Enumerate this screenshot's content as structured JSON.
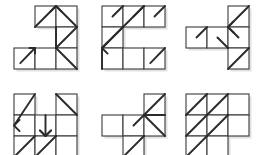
{
  "figure": {
    "background_color": "#ffffff",
    "grid_stroke_color": "#3a3a3a",
    "arrow_stroke_color": "#2b2b2b",
    "shadow_color": "#c9c9c9",
    "cell_size": 21,
    "panel_count": 6,
    "layout": {
      "columns": 3,
      "rows": 2
    }
  },
  "panels": [
    {
      "id": "panel-1",
      "name": "panel-top-left",
      "origin": {
        "x": 14,
        "y": 6
      },
      "cells": [
        {
          "col": 1,
          "row": 0
        },
        {
          "col": 2,
          "row": 0
        },
        {
          "col": 2,
          "row": 1
        },
        {
          "col": 0,
          "row": 2
        },
        {
          "col": 1,
          "row": 2
        },
        {
          "col": 2,
          "row": 2
        }
      ],
      "marks": [
        {
          "type": "line",
          "from": {
            "col": 1,
            "row": 0,
            "at": "bottom-left"
          },
          "to": {
            "col": 1,
            "row": 0,
            "at": "top-right"
          },
          "arrow": "none"
        },
        {
          "type": "line",
          "from": {
            "col": 2,
            "row": 0,
            "at": "bottom-right"
          },
          "to": {
            "col": 2,
            "row": 0,
            "at": "top-left"
          },
          "arrow": "none"
        },
        {
          "type": "arrowhead",
          "at": {
            "col": 2,
            "row": 0,
            "corner": "top-left"
          },
          "direction": "up"
        },
        {
          "type": "line",
          "from": {
            "col": 2,
            "row": 0,
            "at": "bottom-left"
          },
          "to": {
            "col": 2,
            "row": 1,
            "at": "bottom-left"
          },
          "arrow": "none"
        },
        {
          "type": "line",
          "from": {
            "col": 2,
            "row": 1,
            "at": "bottom-left"
          },
          "to": {
            "col": 2,
            "row": 1,
            "at": "top-right"
          },
          "arrow": "none"
        },
        {
          "type": "line",
          "from": {
            "col": 0,
            "row": 2,
            "at": "center-low"
          },
          "to": {
            "col": 0,
            "row": 2,
            "at": "top-right"
          },
          "arrow": "up-right"
        },
        {
          "type": "line",
          "from": {
            "col": 2,
            "row": 2,
            "at": "top-left"
          },
          "to": {
            "col": 2,
            "row": 2,
            "at": "bottom-right"
          },
          "arrow": "none"
        }
      ]
    },
    {
      "id": "panel-2",
      "name": "panel-top-center",
      "origin": {
        "x": 102,
        "y": 6
      },
      "cells": [
        {
          "col": 0,
          "row": 0
        },
        {
          "col": 1,
          "row": 0
        },
        {
          "col": 2,
          "row": 0
        },
        {
          "col": 0,
          "row": 1
        },
        {
          "col": 0,
          "row": 2
        },
        {
          "col": 1,
          "row": 2
        },
        {
          "col": 2,
          "row": 2
        }
      ],
      "marks": [
        {
          "type": "line",
          "from": {
            "col": 0,
            "row": 0,
            "at": "center"
          },
          "to": {
            "col": 0,
            "row": 0,
            "at": "top-right"
          },
          "arrow": "none"
        },
        {
          "type": "line",
          "from": {
            "col": 1,
            "row": 0,
            "at": "center"
          },
          "to": {
            "col": 1,
            "row": 0,
            "at": "top-right"
          },
          "arrow": "none"
        },
        {
          "type": "line",
          "from": {
            "col": 2,
            "row": 0,
            "at": "center"
          },
          "to": {
            "col": 2,
            "row": 0,
            "at": "top-right"
          },
          "arrow": "none"
        },
        {
          "type": "line",
          "from": {
            "col": 0,
            "row": 1,
            "at": "bottom-left"
          },
          "to": {
            "col": 1,
            "row": 0,
            "at": "top-right"
          },
          "arrow": "none",
          "note": "long diagonal spanning two cells"
        },
        {
          "type": "line",
          "from": {
            "col": 0,
            "row": 1,
            "at": "bottom-left"
          },
          "to": {
            "col": 0,
            "row": 1,
            "at": "top-right"
          },
          "arrow": "none"
        },
        {
          "type": "arrowhead",
          "at": {
            "col": 0,
            "row": 1,
            "corner": "bottom-left"
          },
          "direction": "left"
        },
        {
          "type": "line",
          "from": {
            "col": 0,
            "row": 2,
            "at": "bottom-left"
          },
          "to": {
            "col": 0,
            "row": 1,
            "at": "bottom-left"
          },
          "arrow": "none"
        },
        {
          "type": "line",
          "from": {
            "col": 2,
            "row": 2,
            "at": "center-low"
          },
          "to": {
            "col": 2,
            "row": 2,
            "at": "top-right"
          },
          "arrow": "none"
        }
      ]
    },
    {
      "id": "panel-3",
      "name": "panel-top-right",
      "origin": {
        "x": 186,
        "y": 6
      },
      "cells": [
        {
          "col": 2,
          "row": 0
        },
        {
          "col": 0,
          "row": 1
        },
        {
          "col": 1,
          "row": 1
        },
        {
          "col": 2,
          "row": 1
        },
        {
          "col": 2,
          "row": 2
        }
      ],
      "marks": [
        {
          "type": "line",
          "from": {
            "col": 2,
            "row": 0,
            "at": "bottom-left"
          },
          "to": {
            "col": 2,
            "row": 0,
            "at": "top-right"
          },
          "arrow": "none"
        },
        {
          "type": "line",
          "from": {
            "col": 2,
            "row": 0,
            "at": "bottom-left"
          },
          "to": {
            "col": 2,
            "row": 1,
            "at": "center"
          },
          "arrow": "none"
        },
        {
          "type": "arrowhead",
          "at": {
            "col": 2,
            "row": 1,
            "corner": "top-left"
          },
          "direction": "left"
        },
        {
          "type": "line",
          "from": {
            "col": 0,
            "row": 1,
            "at": "center"
          },
          "to": {
            "col": 0,
            "row": 1,
            "at": "top-right"
          },
          "arrow": "none"
        },
        {
          "type": "line",
          "from": {
            "col": 1,
            "row": 1,
            "at": "center"
          },
          "to": {
            "col": 1,
            "row": 1,
            "at": "bottom-right"
          },
          "arrow": "none"
        },
        {
          "type": "line",
          "from": {
            "col": 2,
            "row": 2,
            "at": "bottom-left"
          },
          "to": {
            "col": 2,
            "row": 2,
            "at": "top-right"
          },
          "arrow": "none"
        }
      ]
    },
    {
      "id": "panel-4",
      "name": "panel-bottom-left",
      "origin": {
        "x": 14,
        "y": 94
      },
      "cells": [
        {
          "col": 0,
          "row": 0
        },
        {
          "col": 2,
          "row": 0
        },
        {
          "col": 0,
          "row": 1
        },
        {
          "col": 1,
          "row": 1
        },
        {
          "col": 2,
          "row": 1
        },
        {
          "col": 0,
          "row": 2
        },
        {
          "col": 1,
          "row": 2
        },
        {
          "col": 2,
          "row": 2
        }
      ],
      "marks": [
        {
          "type": "line",
          "from": {
            "col": 0,
            "row": 1,
            "at": "left-mid"
          },
          "to": {
            "col": 0,
            "row": 0,
            "at": "top-right"
          },
          "arrow": "none"
        },
        {
          "type": "arrowhead",
          "at": {
            "col": 0,
            "row": 1,
            "corner": "left-mid"
          },
          "direction": "left"
        },
        {
          "type": "line",
          "from": {
            "col": 2,
            "row": 0,
            "at": "top-left"
          },
          "to": {
            "col": 2,
            "row": 1,
            "at": "top-right"
          },
          "arrow": "none"
        },
        {
          "type": "line",
          "from": {
            "col": 1,
            "row": 1,
            "at": "top-center"
          },
          "to": {
            "col": 1,
            "row": 2,
            "at": "top-center"
          },
          "arrow": "down"
        },
        {
          "type": "arrowhead",
          "at": {
            "col": 1,
            "row": 2,
            "corner": "top-center"
          },
          "direction": "down"
        },
        {
          "type": "line",
          "from": {
            "col": 0,
            "row": 2,
            "at": "bottom-left"
          },
          "to": {
            "col": 1,
            "row": 2,
            "at": "top-left"
          },
          "arrow": "none"
        },
        {
          "type": "line",
          "from": {
            "col": 1,
            "row": 2,
            "at": "bottom-left"
          },
          "to": {
            "col": 1,
            "row": 2,
            "at": "top-right"
          },
          "arrow": "none"
        }
      ]
    },
    {
      "id": "panel-5",
      "name": "panel-bottom-center",
      "origin": {
        "x": 102,
        "y": 94
      },
      "cells": [
        {
          "col": 2,
          "row": 0
        },
        {
          "col": 0,
          "row": 1
        },
        {
          "col": 1,
          "row": 1
        },
        {
          "col": 2,
          "row": 1
        },
        {
          "col": 1,
          "row": 2
        }
      ],
      "marks": [
        {
          "type": "line",
          "from": {
            "col": 2,
            "row": 0,
            "at": "bottom-left"
          },
          "to": {
            "col": 2,
            "row": 0,
            "at": "top-right"
          },
          "arrow": "none"
        },
        {
          "type": "line",
          "from": {
            "col": 2,
            "row": 1,
            "at": "bottom-right"
          },
          "to": {
            "col": 2,
            "row": 0,
            "at": "bottom-left"
          },
          "arrow": "none",
          "note": "long diagonal"
        },
        {
          "type": "line",
          "from": {
            "col": 1,
            "row": 1,
            "at": "center"
          },
          "to": {
            "col": 2,
            "row": 0,
            "at": "bottom-left"
          },
          "arrow": "none"
        },
        {
          "type": "line",
          "from": {
            "col": 2,
            "row": 0,
            "at": "bottom-left"
          },
          "to": {
            "col": 2,
            "row": 1,
            "at": "top-right"
          },
          "arrow": "none"
        },
        {
          "type": "line",
          "from": {
            "col": 1,
            "row": 2,
            "at": "bottom-left"
          },
          "to": {
            "col": 1,
            "row": 2,
            "at": "top-right"
          },
          "arrow": "none"
        }
      ]
    },
    {
      "id": "panel-6",
      "name": "panel-bottom-right",
      "origin": {
        "x": 186,
        "y": 94
      },
      "cells": [
        {
          "col": 0,
          "row": 0
        },
        {
          "col": 1,
          "row": 0
        },
        {
          "col": 2,
          "row": 0
        },
        {
          "col": 0,
          "row": 1
        },
        {
          "col": 1,
          "row": 1
        },
        {
          "col": 2,
          "row": 1
        },
        {
          "col": 0,
          "row": 2
        },
        {
          "col": 1,
          "row": 2
        }
      ],
      "marks": [
        {
          "type": "line",
          "from": {
            "col": 0,
            "row": 0,
            "at": "bottom-left"
          },
          "to": {
            "col": 0,
            "row": 0,
            "at": "top-right"
          },
          "arrow": "none"
        },
        {
          "type": "line",
          "from": {
            "col": 1,
            "row": 0,
            "at": "bottom-left"
          },
          "to": {
            "col": 1,
            "row": 0,
            "at": "top-right"
          },
          "arrow": "none"
        },
        {
          "type": "line",
          "from": {
            "col": 1,
            "row": 0,
            "at": "bottom-right"
          },
          "to": {
            "col": 2,
            "row": 1,
            "at": "top-left"
          },
          "arrow": "none"
        },
        {
          "type": "line",
          "from": {
            "col": 0,
            "row": 1,
            "at": "bottom-left"
          },
          "to": {
            "col": 0,
            "row": 1,
            "at": "top-right"
          },
          "arrow": "none"
        },
        {
          "type": "line",
          "from": {
            "col": 1,
            "row": 1,
            "at": "bottom-left"
          },
          "to": {
            "col": 1,
            "row": 1,
            "at": "top-right"
          },
          "arrow": "none"
        },
        {
          "type": "line",
          "from": {
            "col": 0,
            "row": 2,
            "at": "bottom-left"
          },
          "to": {
            "col": 0,
            "row": 2,
            "at": "top-right"
          },
          "arrow": "none"
        }
      ]
    }
  ]
}
